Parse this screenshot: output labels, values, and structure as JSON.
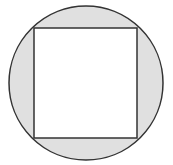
{
  "diagram": {
    "canvas": {
      "width": 173,
      "height": 165
    },
    "circle": {
      "cx": 86,
      "cy": 83,
      "r": 77,
      "fill": "#e0e0e0",
      "stroke": "#333333",
      "stroke_width": 1.5
    },
    "square": {
      "x": 34,
      "y": 28,
      "width": 103,
      "height": 110,
      "fill": "#ffffff",
      "stroke": "#333333",
      "stroke_width": 1.5
    },
    "shaded_regions": 4
  }
}
